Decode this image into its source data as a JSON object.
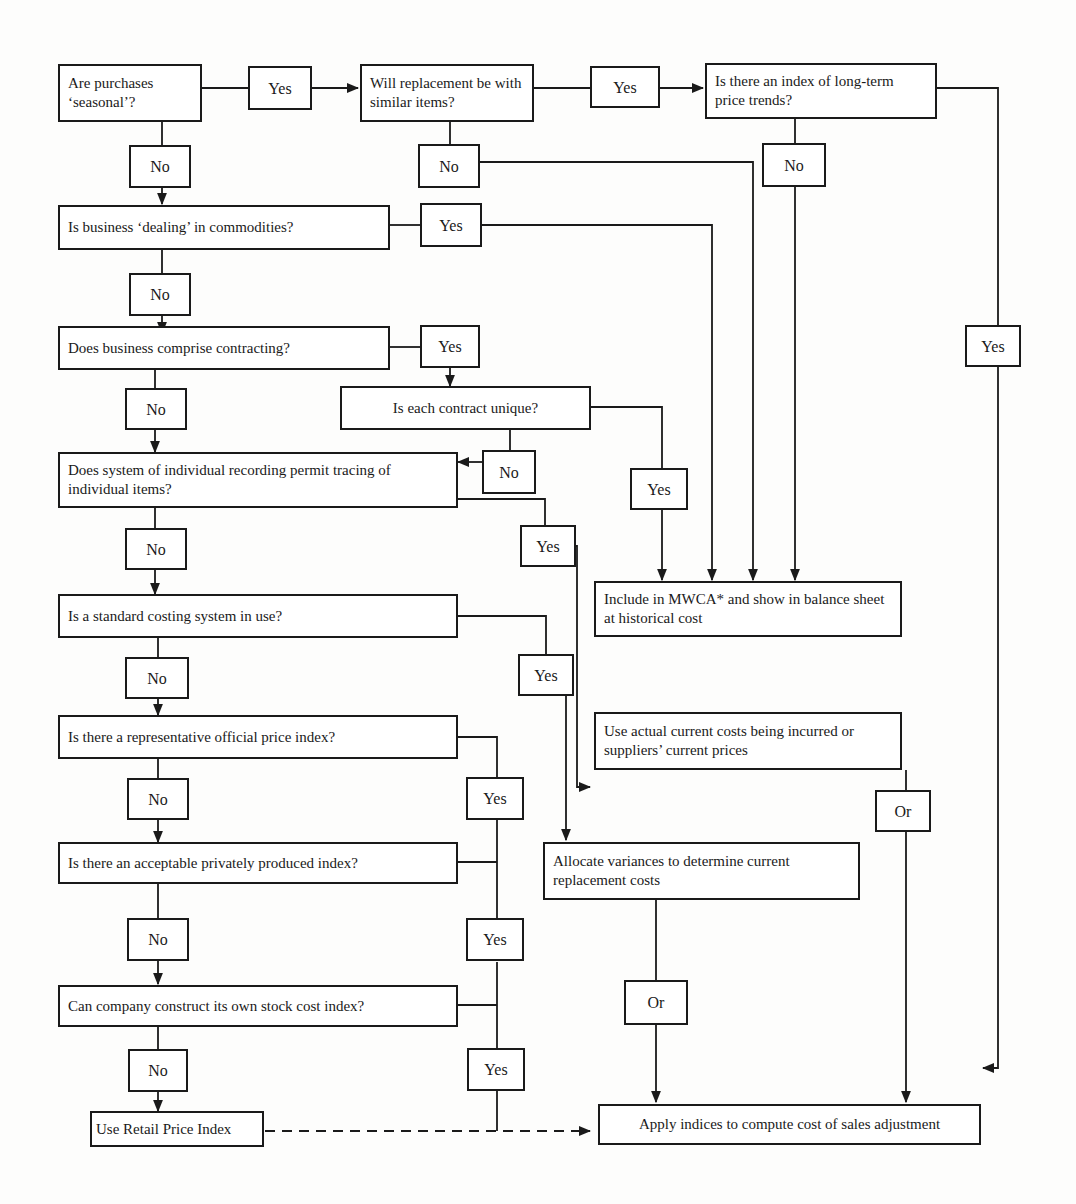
{
  "diagram": {
    "type": "flowchart",
    "questions": {
      "q1": "Are purchases ‘seasonal’?",
      "q2": "Will replacement be with similar items?",
      "q3": "Is there an index of long-term price trends?",
      "q4": "Is business ‘dealing’ in commodities?",
      "q5": "Does business comprise contracting?",
      "q6": "Is each contract unique?",
      "q7": "Does system of individual recording permit tracing of individual items?",
      "q8": "Is a standard costing system in use?",
      "q9": "Is there a representative official price index?",
      "q10": "Is there an acceptable privately produced index?",
      "q11": "Can company construct its own stock cost index?"
    },
    "outcomes": {
      "mwca": "Include in MWCA* and show in balance sheet at historical cost",
      "actual": "Use actual current costs being incurred or suppliers’ current prices",
      "allocate": "Allocate variances to determine current replacement costs",
      "rpi": "Use Retail Price Index",
      "apply": "Apply indices to compute cost of sales adjustment"
    },
    "labels": {
      "yes": "Yes",
      "no": "No",
      "or": "Or"
    }
  }
}
